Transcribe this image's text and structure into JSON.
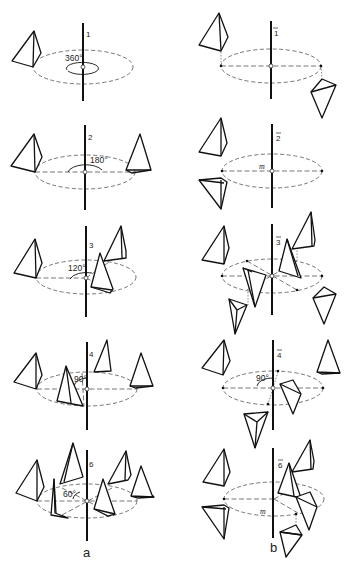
{
  "figure": {
    "columns": [
      {
        "id": "a",
        "label": "a",
        "description": "proper rotation axes"
      },
      {
        "id": "b",
        "label": "b",
        "description": "rotoinversion axes"
      }
    ],
    "rows": [
      {
        "a": {
          "axis_label": "1",
          "angle": "360°"
        },
        "b": {
          "axis_label": "1",
          "overbar": true
        }
      },
      {
        "a": {
          "axis_label": "2",
          "angle": "180°"
        },
        "b": {
          "axis_label": "2",
          "overbar": true,
          "mirror_label": "m"
        }
      },
      {
        "a": {
          "axis_label": "3",
          "angle": "120°"
        },
        "b": {
          "axis_label": "3",
          "overbar": true
        }
      },
      {
        "a": {
          "axis_label": "4",
          "angle": "90°"
        },
        "b": {
          "axis_label": "4",
          "overbar": true,
          "angle": "90°"
        }
      },
      {
        "a": {
          "axis_label": "6",
          "angle": "60°"
        },
        "b": {
          "axis_label": "6",
          "overbar": true,
          "mirror_label": "m"
        }
      }
    ],
    "object_shape": "tetrahedron",
    "line_color": "#111111",
    "dashed_color": "#666666",
    "background": "#ffffff"
  }
}
